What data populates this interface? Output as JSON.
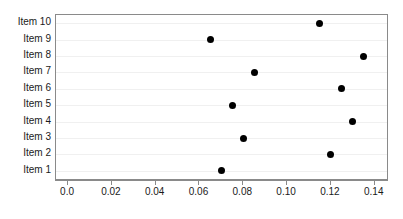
{
  "chart_data": {
    "type": "scatter",
    "title": "",
    "subtitle": "",
    "xlabel": "",
    "ylabel": "",
    "categories": [
      "Item 1",
      "Item 2",
      "Item 3",
      "Item 4",
      "Item 5",
      "Item 6",
      "Item 7",
      "Item 8",
      "Item 9",
      "Item 10"
    ],
    "values": [
      0.07,
      0.12,
      0.08,
      0.13,
      0.075,
      0.125,
      0.085,
      0.135,
      0.065,
      0.115
    ],
    "points": [
      {
        "category": "Item 10",
        "value": 0.115
      },
      {
        "category": "Item 9",
        "value": 0.065
      },
      {
        "category": "Item 8",
        "value": 0.135
      },
      {
        "category": "Item 7",
        "value": 0.085
      },
      {
        "category": "Item 6",
        "value": 0.125
      },
      {
        "category": "Item 5",
        "value": 0.075
      },
      {
        "category": "Item 4",
        "value": 0.13
      },
      {
        "category": "Item 3",
        "value": 0.08
      },
      {
        "category": "Item 2",
        "value": 0.12
      },
      {
        "category": "Item 1",
        "value": 0.07
      }
    ],
    "xlim": [
      -0.0055,
      0.1456
    ],
    "xticks": [
      0.0,
      0.02,
      0.04,
      0.06,
      0.08,
      0.1,
      0.12,
      0.14
    ],
    "xticklabels": [
      "0.0",
      "0.02",
      "0.04",
      "0.06",
      "0.08",
      "0.10",
      "0.12",
      "0.14"
    ],
    "yticklabels": [
      "Item 10",
      "Item 9",
      "Item 8",
      "Item 7",
      "Item 6",
      "Item 5",
      "Item 4",
      "Item 3",
      "Item 2",
      "Item 1"
    ],
    "grid": true,
    "grid_axis": "y",
    "legend": false,
    "legend_position": "none",
    "marker": "filled-circle",
    "marker_color": "#000000",
    "grid_color": "#f0f0f0",
    "frame_color": "#8a8a8a",
    "background": "#ffffff"
  }
}
